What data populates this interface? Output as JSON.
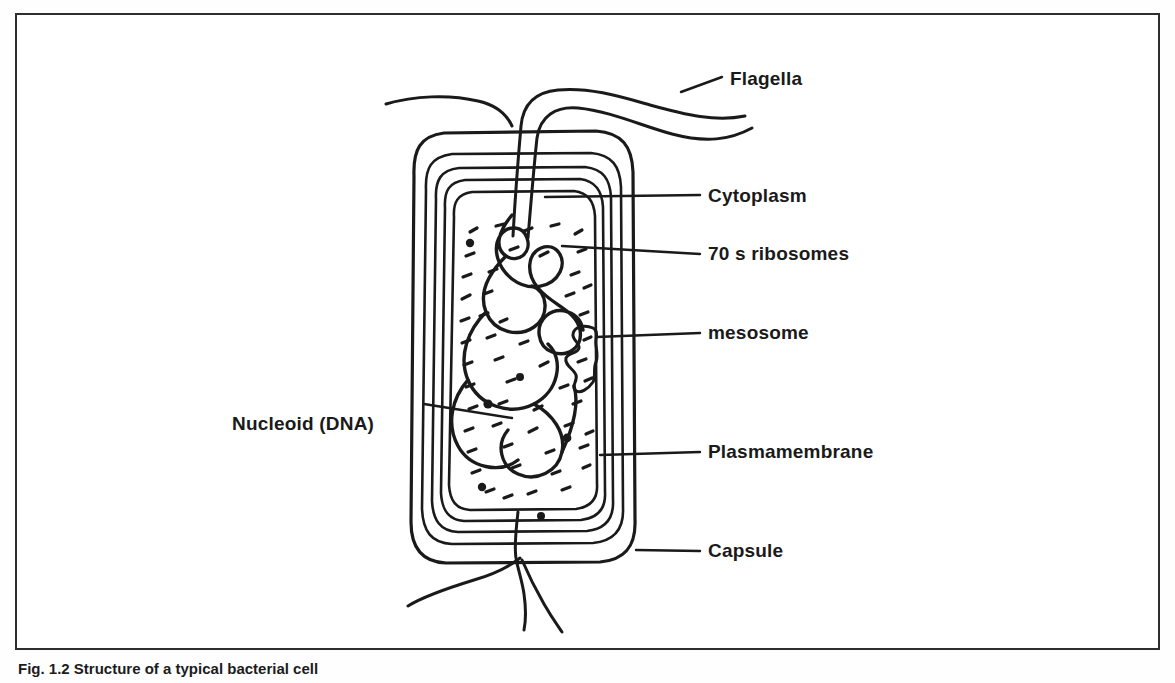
{
  "figure": {
    "caption": "Fig. 1.2  Structure of a typical bacterial cell",
    "border_color": "#2e2e2e",
    "ink_color": "#1a1a1a",
    "background": "#ffffff"
  },
  "labels": {
    "flagella": "Flagella",
    "cytoplasm": "Cytoplasm",
    "ribosomes": "70 s ribosomes",
    "mesosome": "mesosome",
    "nucleoid": "Nucleoid (DNA)",
    "plasmamembrane": "Plasmamembrane",
    "capsule": "Capsule"
  },
  "diagram": {
    "type": "labeled-biological-diagram",
    "subject": "bacterial cell",
    "structures": [
      "capsule",
      "cell wall",
      "plasmamembrane",
      "cytoplasm",
      "70 s ribosomes",
      "nucleoid (DNA)",
      "mesosome",
      "flagella"
    ],
    "envelope_layers": 5,
    "flagella_top_count": 2,
    "flagella_bottom_count": 3,
    "orientation": "vertical rounded rectangle cell"
  }
}
